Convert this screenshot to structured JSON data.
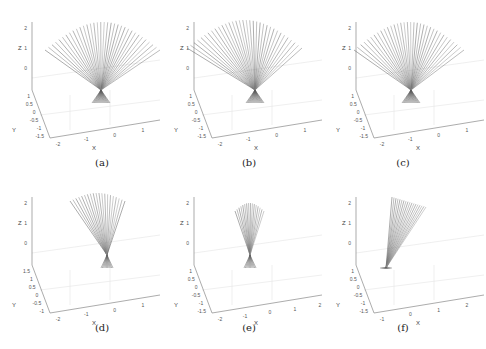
{
  "figure": {
    "panels": [
      {
        "id": "a",
        "caption": "(a)",
        "x": 0,
        "y": 0,
        "fan": {
          "apex": [
            101,
            90
          ],
          "spread": "wide",
          "tips_y": 22,
          "tips_x": [
            45,
            160
          ],
          "base_y": 103,
          "rays": 34
        },
        "axes": {
          "z_label": "Z",
          "z_ticks": [
            "2",
            "1",
            "0"
          ],
          "y_label": "Y",
          "y_ticks": [
            "1",
            "0.5",
            "0",
            "-0.5",
            "-1",
            "-1.5"
          ],
          "x_label": "X",
          "x_ticks": [
            "-2",
            "-1",
            "0",
            "1"
          ]
        }
      },
      {
        "id": "b",
        "caption": "(b)",
        "x": 162,
        "y": 0,
        "fan": {
          "apex": [
            93,
            90
          ],
          "spread": "wide",
          "tips_y": 20,
          "tips_x": [
            25,
            140
          ],
          "base_y": 103,
          "rays": 34
        },
        "axes": {
          "z_label": "Z",
          "z_ticks": [
            "2",
            "1",
            "0"
          ],
          "y_label": "Y",
          "y_ticks": [
            "1",
            "0.5",
            "0",
            "-0.5",
            "-1",
            "-1.5"
          ],
          "x_label": "X",
          "x_ticks": [
            "-2",
            "-1",
            "0",
            "1"
          ]
        }
      },
      {
        "id": "c",
        "caption": "(c)",
        "x": 324,
        "y": 0,
        "fan": {
          "apex": [
            87,
            90
          ],
          "spread": "wide",
          "tips_y": 22,
          "tips_x": [
            30,
            140
          ],
          "base_y": 103,
          "rays": 34
        },
        "axes": {
          "z_label": "Z",
          "z_ticks": [
            "2",
            "1",
            "0"
          ],
          "y_label": "Y",
          "y_ticks": [
            "1",
            "0.5",
            "0",
            "-0.5",
            "-1",
            "-1.5"
          ],
          "x_label": "X",
          "x_ticks": [
            "-2",
            "-1",
            "0",
            "1"
          ]
        }
      },
      {
        "id": "d",
        "caption": "(d)",
        "x": 0,
        "y": 175,
        "fan": {
          "apex": [
            107,
            80
          ],
          "spread": "medium",
          "tips_y": 18,
          "tips_x": [
            70,
            125
          ],
          "base_y": 93,
          "rays": 20
        },
        "axes": {
          "z_label": "Z",
          "z_ticks": [
            "2",
            "1",
            "0"
          ],
          "y_label": "Y",
          "y_ticks": [
            "1.5",
            "1",
            "0.5",
            "0",
            "-0.5",
            "-1"
          ],
          "x_label": "X",
          "x_ticks": [
            "-2",
            "-1",
            "0",
            "1"
          ]
        }
      },
      {
        "id": "e",
        "caption": "(e)",
        "x": 162,
        "y": 175,
        "fan": {
          "apex": [
            88,
            80
          ],
          "spread": "narrow",
          "tips_y": 28,
          "tips_x": [
            73,
            102
          ],
          "base_y": 93,
          "rays": 16
        },
        "axes": {
          "z_label": "Z",
          "z_ticks": [
            "2",
            "1",
            "0"
          ],
          "y_label": "Y",
          "y_ticks": [
            "1",
            "0.5",
            "0",
            "-0.5",
            "-1",
            "-1.5"
          ],
          "x_label": "X",
          "x_ticks": [
            "-2",
            "-1",
            "0",
            "1",
            "2"
          ]
        }
      },
      {
        "id": "f",
        "caption": "(f)",
        "x": 324,
        "y": 175,
        "fan": {
          "apex": [
            62,
            93
          ],
          "spread": "tilted",
          "tips_y": 22,
          "tips_x": [
            68,
            102
          ],
          "base_y": 93,
          "rays": 18
        },
        "axes": {
          "z_label": "Z",
          "z_ticks": [
            "2",
            "1",
            "0"
          ],
          "y_label": "Y",
          "y_ticks": [
            "1",
            "0.5",
            "0",
            "-0.5",
            "-1",
            "-1.5"
          ],
          "x_label": "X",
          "x_ticks": [
            "-1",
            "0",
            "1",
            "2"
          ]
        }
      }
    ],
    "colors": {
      "ray": "#6e6e6e",
      "axis": "#888888",
      "grid": "#e4e4e4",
      "caption": "#222222"
    }
  }
}
